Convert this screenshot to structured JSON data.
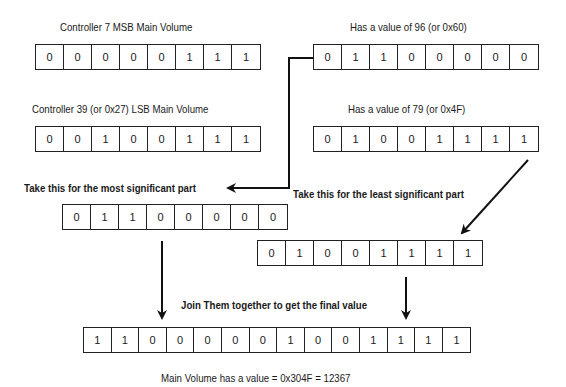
{
  "labels": {
    "msb_controller": "Controller 7 MSB Main Volume",
    "msb_value": "Has a value of 96 (or 0x60)",
    "lsb_controller": "Controller 39 (or 0x27) LSB Main Volume",
    "lsb_value": "Has a value of 79 (or 0x4F)",
    "take_msb": "Take this for the most significant part",
    "take_lsb": "Take this for the least significant part",
    "join": "Join Them together to get the final value",
    "result": "Main Volume has a value = 0x304F = 12367"
  },
  "rows": {
    "msb_controller_bits": [
      "0",
      "0",
      "0",
      "0",
      "0",
      "1",
      "1",
      "1"
    ],
    "msb_value_bits": [
      "0",
      "1",
      "1",
      "0",
      "0",
      "0",
      "0",
      "0"
    ],
    "lsb_controller_bits": [
      "0",
      "0",
      "1",
      "0",
      "0",
      "1",
      "1",
      "1"
    ],
    "lsb_value_bits": [
      "0",
      "1",
      "0",
      "0",
      "1",
      "1",
      "1",
      "1"
    ],
    "msb_part_bits": [
      "0",
      "1",
      "1",
      "0",
      "0",
      "0",
      "0",
      "0"
    ],
    "lsb_part_bits": [
      "0",
      "1",
      "0",
      "0",
      "1",
      "1",
      "1",
      "1"
    ],
    "final_bits": [
      "1",
      "1",
      "0",
      "0",
      "0",
      "0",
      "0",
      "1",
      "0",
      "0",
      "1",
      "1",
      "1",
      "1"
    ]
  }
}
